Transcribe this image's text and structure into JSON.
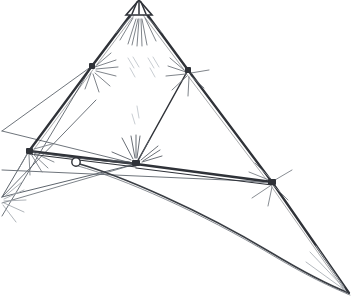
{
  "document": {
    "title": "Tensioned Sail Frame Line Drawing",
    "kind": "technical-line-drawing",
    "width": 354,
    "height": 305,
    "background_color": "#ffffff"
  },
  "palette": {
    "ink_dark": "#2f3238",
    "ink_medium": "#5a5f66",
    "ink_light": "#9aa0a8",
    "ink_faint": "#c5c9ce",
    "background": "#ffffff"
  },
  "nodes": [
    {
      "name": "apex-node",
      "x": 139,
      "y": 6,
      "label": "apex"
    },
    {
      "name": "left-shoulder-node",
      "x": 92,
      "y": 66,
      "label": "left shoulder"
    },
    {
      "name": "right-shoulder-node",
      "x": 188,
      "y": 70,
      "label": "right shoulder"
    },
    {
      "name": "left-spar-end-node",
      "x": 29,
      "y": 151,
      "label": "left spar end"
    },
    {
      "name": "center-hub-node",
      "x": 136,
      "y": 164,
      "label": "center hub"
    },
    {
      "name": "right-spar-end-node",
      "x": 272,
      "y": 182,
      "label": "right spar end"
    },
    {
      "name": "ring-eyelet",
      "x": 76,
      "y": 162,
      "label": "ring eyelet",
      "radius": 4.2
    },
    {
      "name": "left-edge-node",
      "x": 2,
      "y": 197,
      "label": "left edge convergence"
    },
    {
      "name": "tail-tip-node",
      "x": 349,
      "y": 293,
      "label": "tail tip"
    }
  ],
  "members": [
    {
      "name": "spar-apex-to-left-shoulder",
      "from": "apex-node",
      "to": "left-shoulder-node",
      "weight": "heavy"
    },
    {
      "name": "spar-apex-to-right-shoulder",
      "from": "apex-node",
      "to": "right-shoulder-node",
      "weight": "heavy"
    },
    {
      "name": "spar-left-shoulder-to-spar-end",
      "from": "left-shoulder-node",
      "to": "left-spar-end-node",
      "weight": "heavy"
    },
    {
      "name": "spar-right-shoulder-to-tail",
      "from": "right-shoulder-node",
      "to": "tail-tip-node",
      "weight": "heavy"
    },
    {
      "name": "spar-right-shoulder-to-hub",
      "from": "right-shoulder-node",
      "to": "center-hub-node",
      "weight": "medium"
    },
    {
      "name": "cross-spar-left",
      "from": "left-spar-end-node",
      "to": "center-hub-node",
      "weight": "heavy"
    },
    {
      "name": "cross-spar-right",
      "from": "center-hub-node",
      "to": "right-spar-end-node",
      "weight": "heavy"
    },
    {
      "name": "stay-left-shoulder-to-edge",
      "from": "left-shoulder-node",
      "to": "left-edge-node",
      "weight": "light"
    },
    {
      "name": "stay-edge-to-hub",
      "from": "left-edge-node",
      "to": "center-hub-node",
      "weight": "light"
    },
    {
      "name": "stay-edge-to-spar-end",
      "from": "left-edge-node",
      "to": "right-spar-end-node",
      "weight": "light"
    },
    {
      "name": "stay-spar-end-to-bottom-left",
      "from": "left-spar-end-node",
      "to": "left-edge-node",
      "weight": "light"
    }
  ],
  "curves": [
    {
      "name": "sail-leech-curve",
      "label": "lower sail edge",
      "weight": "heavy"
    },
    {
      "name": "sail-foot-curve",
      "label": "foot sweep",
      "weight": "medium"
    }
  ],
  "apex_cap": {
    "name": "apex-hatched-cap",
    "label": "hatched fan cap",
    "stripe_count": 4,
    "width": 26,
    "height": 14
  },
  "burst_marks": [
    {
      "name": "burst-apex",
      "at": "apex-node",
      "rays": 11,
      "spread": 150,
      "length": 26,
      "tone": "medium"
    },
    {
      "name": "burst-left-shoulder",
      "at": "left-shoulder-node",
      "rays": 9,
      "spread": 120,
      "length": 22,
      "tone": "medium"
    },
    {
      "name": "burst-right-shoulder",
      "at": "right-shoulder-node",
      "rays": 9,
      "spread": 130,
      "length": 21,
      "tone": "medium"
    },
    {
      "name": "burst-center-hub",
      "at": "center-hub-node",
      "rays": 12,
      "spread": 150,
      "length": 27,
      "tone": "dark"
    },
    {
      "name": "burst-left-spar-end",
      "at": "left-spar-end-node",
      "rays": 8,
      "spread": 110,
      "length": 20,
      "tone": "medium"
    },
    {
      "name": "burst-right-spar-end",
      "at": "right-spar-end-node",
      "rays": 10,
      "spread": 140,
      "length": 26,
      "tone": "medium"
    },
    {
      "name": "burst-left-edge",
      "at": "left-edge-node",
      "rays": 7,
      "spread": 90,
      "length": 22,
      "tone": "light"
    },
    {
      "name": "burst-tail-tip",
      "at": "tail-tip-node",
      "rays": 5,
      "spread": 40,
      "length": 44,
      "tone": "light"
    }
  ],
  "hatch_marks": [
    {
      "name": "hatch-upper-left",
      "x": 131,
      "y": 62,
      "angle": 28,
      "strokes": 3,
      "tone": "faint"
    },
    {
      "name": "hatch-upper-right",
      "x": 150,
      "y": 62,
      "angle": 28,
      "strokes": 3,
      "tone": "faint"
    }
  ]
}
